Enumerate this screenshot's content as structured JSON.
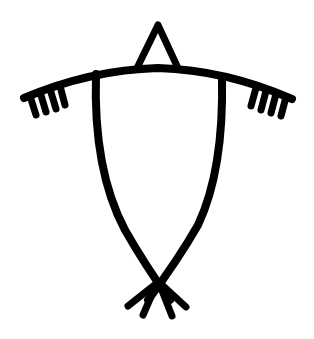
{
  "figure": {
    "colors": {
      "background": "#ffffff",
      "ink": "#000000"
    },
    "parts": {
      "triangle": "triangle-top",
      "crossbar": "curved-crossbar",
      "left_fringe_count": 4,
      "right_fringe_count": 4,
      "body": "crossed-body-lines",
      "base_strokes_count": 4
    }
  }
}
